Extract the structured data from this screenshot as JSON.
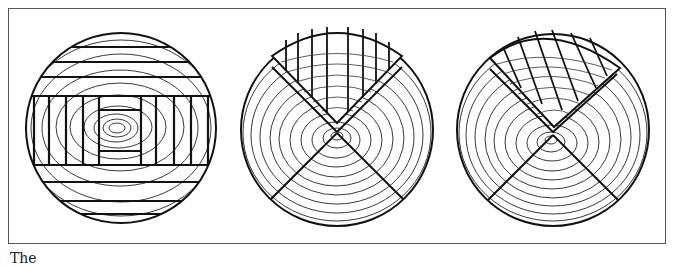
{
  "figure": {
    "panels": [
      {
        "id": "log-sawing-pattern",
        "label": "Log cut into boards around a central boxed heart",
        "center": [
          121,
          128
        ],
        "radius": 96
      },
      {
        "id": "quartersawn-radial",
        "label": "Quartered log with one quarter cut by vertical boards",
        "center": [
          337,
          130
        ],
        "radius": 97
      },
      {
        "id": "quartersawn-diagonal",
        "label": "Quartered log with one quarter cut by diagonal boards",
        "center": [
          553,
          130
        ],
        "radius": 97
      }
    ],
    "colors": {
      "ink": "#111111",
      "frame": "#555555",
      "background": "#ffffff"
    }
  },
  "caption": {
    "text": "The"
  }
}
